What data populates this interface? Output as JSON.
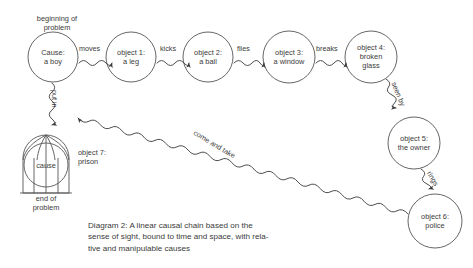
{
  "diagram": {
    "background_color": "#ffffff",
    "stroke_color": "#555555",
    "text_color": "#3a3a3a",
    "caption": "Diagram 2: A linear causal chain based on the\nsense of sight, bound to time and space, with rela-\ntive and manipulable causes",
    "annotations": {
      "beginning": "beginning of\nproblem",
      "end": "end of\nproblem",
      "prison_label": "object 7:\nprison",
      "prison_inner": "cause"
    },
    "nodes": [
      {
        "id": "cause",
        "label": "Cause:\na boy",
        "cx": 53,
        "cy": 57,
        "r": 25,
        "shape": "circle"
      },
      {
        "id": "object1",
        "label": "object 1:\na leg",
        "cx": 131,
        "cy": 57,
        "r": 25,
        "shape": "circle"
      },
      {
        "id": "object2",
        "label": "object 2:\na ball",
        "cx": 208,
        "cy": 57,
        "r": 25,
        "shape": "circle"
      },
      {
        "id": "object3",
        "label": "object 3:\na window",
        "cx": 289,
        "cy": 57,
        "r": 26,
        "shape": "circle"
      },
      {
        "id": "object4",
        "label": "object 4:\nbroken\nglass",
        "cx": 371,
        "cy": 57,
        "r": 26,
        "shape": "circle"
      },
      {
        "id": "object5",
        "label": "object 5:\nthe owner",
        "cx": 414,
        "cy": 143,
        "r": 26,
        "shape": "circle"
      },
      {
        "id": "object6",
        "label": "object 6:\npolice",
        "cx": 435,
        "cy": 221,
        "r": 27,
        "shape": "circle"
      },
      {
        "id": "object7",
        "label": "cause",
        "cx": 46,
        "cy": 165,
        "r": 22,
        "shape": "cage"
      }
    ],
    "edges": [
      {
        "from": "cause",
        "to": "object1",
        "label": "moves"
      },
      {
        "from": "object1",
        "to": "object2",
        "label": "kicks"
      },
      {
        "from": "object2",
        "to": "object3",
        "label": "flies"
      },
      {
        "from": "object3",
        "to": "object4",
        "label": "breaks"
      },
      {
        "from": "object4",
        "to": "object5",
        "label": "seen by"
      },
      {
        "from": "object5",
        "to": "object6",
        "label": "rings"
      },
      {
        "from": "object6",
        "to": "cause",
        "label": "come and take"
      },
      {
        "from": "cause",
        "to": "object7",
        "label": "put in"
      }
    ]
  }
}
